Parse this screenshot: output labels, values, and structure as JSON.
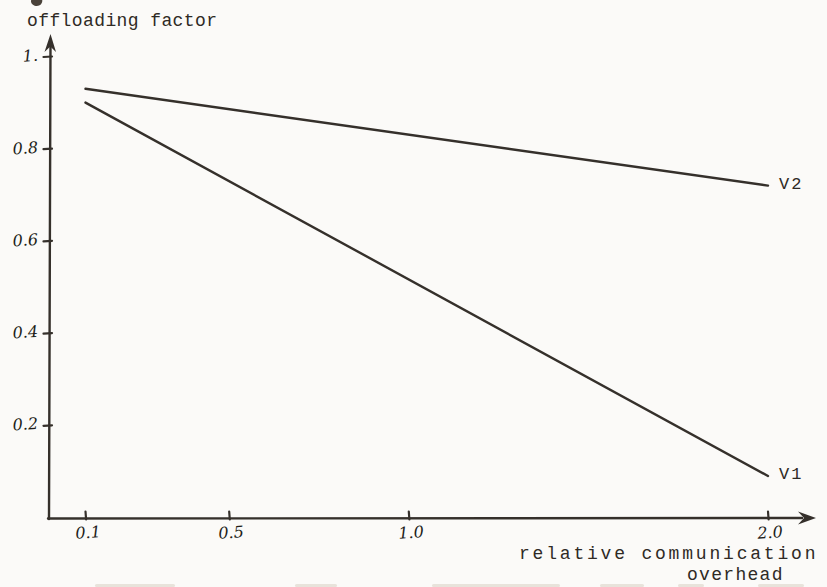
{
  "page": {
    "background": "#fbfaf8",
    "ink": "#35302b",
    "handwriting_ink": "#221d18",
    "ghost_color": "#d9d0c3"
  },
  "chart_data": {
    "type": "line",
    "title": "",
    "ylabel": "offloading factor",
    "xlabel_lines": [
      "relative communication",
      "overhead"
    ],
    "xlim": [
      0.1,
      2.0
    ],
    "ylim": [
      0,
      1.0
    ],
    "grid": false,
    "legend": "inline-end-of-line-labels",
    "xticks": [
      {
        "value": 0.1,
        "label": "0.1"
      },
      {
        "value": 0.5,
        "label": "0.5"
      },
      {
        "value": 1.0,
        "label": "1.0"
      },
      {
        "value": 2.0,
        "label": "2.0"
      }
    ],
    "yticks": [
      {
        "value": 1.0,
        "label": "1."
      },
      {
        "value": 0.8,
        "label": "0.8"
      },
      {
        "value": 0.6,
        "label": "0.6"
      },
      {
        "value": 0.4,
        "label": "0.4"
      },
      {
        "value": 0.2,
        "label": "0.2"
      }
    ],
    "series": [
      {
        "name": "V2",
        "points": [
          [
            0.1,
            0.93
          ],
          [
            2.0,
            0.72
          ]
        ]
      },
      {
        "name": "V1",
        "points": [
          [
            0.1,
            0.9
          ],
          [
            2.0,
            0.09
          ]
        ]
      }
    ]
  }
}
